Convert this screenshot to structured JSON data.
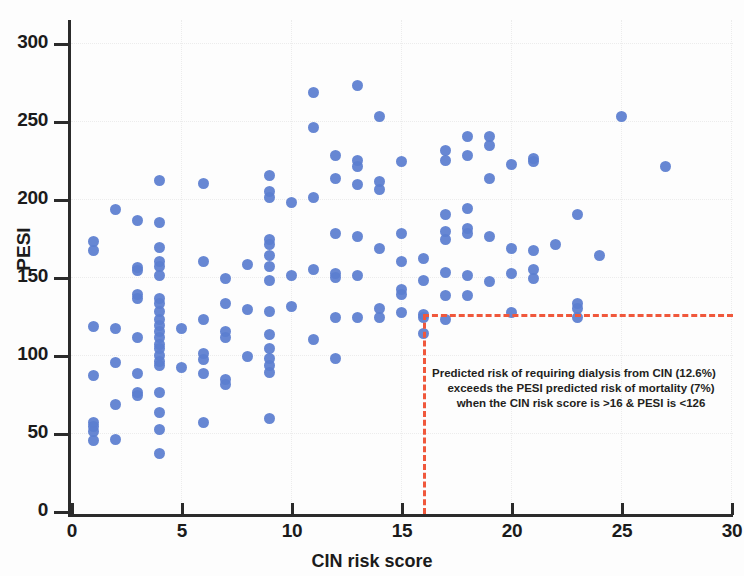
{
  "chart_data": {
    "type": "scatter",
    "title": "",
    "xlabel": "CIN risk score",
    "ylabel": "PESI",
    "xlim": [
      0,
      30
    ],
    "ylim": [
      0,
      300
    ],
    "xticks": [
      0,
      5,
      10,
      15,
      20,
      25,
      30
    ],
    "yticks": [
      0,
      50,
      100,
      150,
      200,
      250,
      300
    ],
    "grid": true,
    "legend": "none",
    "marker_color": "#5b7ed0",
    "reference_color": "#f0583c",
    "reference_lines": {
      "vertical_x": 16,
      "horizontal_y": 126,
      "style": "dash-dot"
    },
    "annotation": {
      "line1": "Predicted risk of requiring dialysis from CIN (12.6%)",
      "line2": "exceeds the PESI predicted risk of mortality (7%)",
      "line3": "when the CIN risk score is >16 & PESI is <126"
    },
    "points": [
      [
        1,
        173
      ],
      [
        1,
        167
      ],
      [
        1,
        118
      ],
      [
        1,
        87
      ],
      [
        1,
        57
      ],
      [
        1,
        54
      ],
      [
        1,
        51
      ],
      [
        1,
        45
      ],
      [
        2,
        193
      ],
      [
        2,
        117
      ],
      [
        2,
        95
      ],
      [
        2,
        68
      ],
      [
        2,
        46
      ],
      [
        3,
        186
      ],
      [
        3,
        156
      ],
      [
        3,
        154
      ],
      [
        3,
        139
      ],
      [
        3,
        136
      ],
      [
        3,
        111
      ],
      [
        3,
        88
      ],
      [
        3,
        76
      ],
      [
        3,
        74
      ],
      [
        4,
        212
      ],
      [
        4,
        185
      ],
      [
        4,
        169
      ],
      [
        4,
        160
      ],
      [
        4,
        157
      ],
      [
        4,
        151
      ],
      [
        4,
        136
      ],
      [
        4,
        133
      ],
      [
        4,
        128
      ],
      [
        4,
        123
      ],
      [
        4,
        119
      ],
      [
        4,
        115
      ],
      [
        4,
        111
      ],
      [
        4,
        107
      ],
      [
        4,
        104
      ],
      [
        4,
        100
      ],
      [
        4,
        96
      ],
      [
        4,
        93
      ],
      [
        4,
        76
      ],
      [
        4,
        63
      ],
      [
        4,
        52
      ],
      [
        4,
        37
      ],
      [
        5,
        117
      ],
      [
        5,
        92
      ],
      [
        6,
        210
      ],
      [
        6,
        160
      ],
      [
        6,
        123
      ],
      [
        6,
        101
      ],
      [
        6,
        97
      ],
      [
        6,
        88
      ],
      [
        6,
        57
      ],
      [
        7,
        149
      ],
      [
        7,
        133
      ],
      [
        7,
        115
      ],
      [
        7,
        111
      ],
      [
        7,
        84
      ],
      [
        7,
        81
      ],
      [
        8,
        158
      ],
      [
        8,
        129
      ],
      [
        8,
        99
      ],
      [
        9,
        215
      ],
      [
        9,
        205
      ],
      [
        9,
        201
      ],
      [
        9,
        174
      ],
      [
        9,
        171
      ],
      [
        9,
        164
      ],
      [
        9,
        157
      ],
      [
        9,
        148
      ],
      [
        9,
        128
      ],
      [
        9,
        113
      ],
      [
        9,
        104
      ],
      [
        9,
        98
      ],
      [
        9,
        93
      ],
      [
        9,
        89
      ],
      [
        9,
        59
      ],
      [
        10,
        198
      ],
      [
        10,
        151
      ],
      [
        10,
        131
      ],
      [
        11,
        246
      ],
      [
        11,
        268
      ],
      [
        11,
        201
      ],
      [
        11,
        155
      ],
      [
        11,
        110
      ],
      [
        12,
        228
      ],
      [
        12,
        213
      ],
      [
        12,
        178
      ],
      [
        12,
        152
      ],
      [
        12,
        150
      ],
      [
        12,
        124
      ],
      [
        12,
        98
      ],
      [
        13,
        273
      ],
      [
        13,
        225
      ],
      [
        13,
        221
      ],
      [
        13,
        209
      ],
      [
        13,
        176
      ],
      [
        13,
        151
      ],
      [
        13,
        124
      ],
      [
        14,
        253
      ],
      [
        14,
        211
      ],
      [
        14,
        206
      ],
      [
        14,
        168
      ],
      [
        14,
        130
      ],
      [
        14,
        124
      ],
      [
        15,
        224
      ],
      [
        15,
        178
      ],
      [
        15,
        160
      ],
      [
        15,
        142
      ],
      [
        15,
        139
      ],
      [
        15,
        127
      ],
      [
        16,
        162
      ],
      [
        16,
        148
      ],
      [
        16,
        126
      ],
      [
        16,
        124
      ],
      [
        16,
        114
      ],
      [
        17,
        231
      ],
      [
        17,
        225
      ],
      [
        17,
        190
      ],
      [
        17,
        179
      ],
      [
        17,
        174
      ],
      [
        17,
        153
      ],
      [
        17,
        138
      ],
      [
        17,
        123
      ],
      [
        18,
        240
      ],
      [
        18,
        228
      ],
      [
        18,
        194
      ],
      [
        18,
        181
      ],
      [
        18,
        178
      ],
      [
        18,
        151
      ],
      [
        18,
        138
      ],
      [
        19,
        240
      ],
      [
        19,
        234
      ],
      [
        19,
        213
      ],
      [
        19,
        176
      ],
      [
        19,
        147
      ],
      [
        20,
        222
      ],
      [
        20,
        168
      ],
      [
        20,
        152
      ],
      [
        20,
        127
      ],
      [
        21,
        224
      ],
      [
        21,
        226
      ],
      [
        21,
        167
      ],
      [
        21,
        155
      ],
      [
        21,
        149
      ],
      [
        22,
        171
      ],
      [
        23,
        190
      ],
      [
        23,
        133
      ],
      [
        23,
        130
      ],
      [
        23,
        124
      ],
      [
        24,
        164
      ],
      [
        25,
        253
      ],
      [
        27,
        221
      ]
    ]
  }
}
